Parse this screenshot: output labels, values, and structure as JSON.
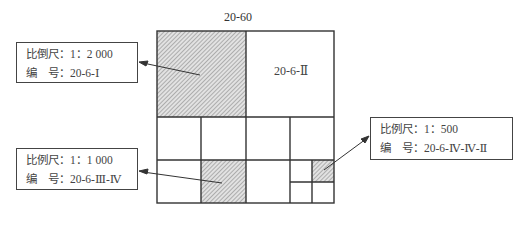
{
  "diagram": {
    "sheet_title": "20-60",
    "cell_label": "20-6-Ⅱ",
    "labels": [
      {
        "scale_label": "比倒尺：1：2 000",
        "number_label": "编　号：20-6-Ⅰ"
      },
      {
        "scale_label": "比例尺：1：1 000",
        "number_label": "编　号：20-6-Ⅲ-Ⅳ"
      },
      {
        "scale_label": "比例尺：1：500",
        "number_label": "编　号：20-6-Ⅳ-Ⅳ-Ⅱ"
      }
    ],
    "colors": {
      "line": "#333333",
      "hatch_bg": "#d8d8d8",
      "hatch_line": "#888888"
    }
  }
}
